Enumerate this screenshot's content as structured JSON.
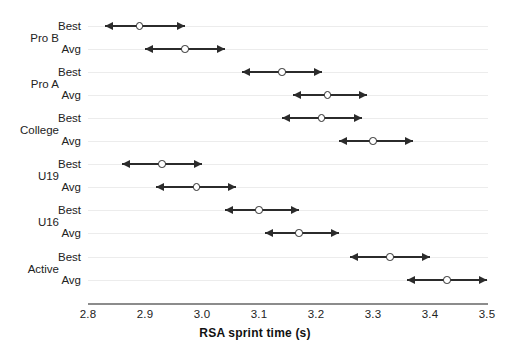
{
  "chart_data": {
    "type": "scatter",
    "title": "",
    "xlabel": "RSA sprint time (s)",
    "ylabel": "",
    "xlim": [
      2.8,
      3.5
    ],
    "xticks": [
      "2.8",
      "2.9",
      "3.0",
      "3.1",
      "3.2",
      "3.3",
      "3.4",
      "3.5"
    ],
    "xtick_values": [
      2.8,
      2.9,
      3.0,
      3.1,
      3.2,
      3.3,
      3.4,
      3.5
    ],
    "grid": true,
    "legend": "none",
    "marker_style": "open-circle-with-double-headed-arrow-range",
    "groups": [
      "Pro B",
      "Pro A",
      "College",
      "U19",
      "U16",
      "Active"
    ],
    "subcategories": [
      "Best",
      "Avg"
    ],
    "categories": [
      "Pro B Best",
      "Pro B Avg",
      "Pro A Best",
      "Pro A Avg",
      "College Best",
      "College Avg",
      "U19 Best",
      "U19 Avg",
      "U16 Best",
      "U16 Avg",
      "Active Best",
      "Active Avg"
    ],
    "values": [
      2.89,
      2.97,
      3.14,
      3.22,
      3.21,
      3.3,
      2.93,
      2.99,
      3.1,
      3.17,
      3.33,
      3.43
    ],
    "lower": [
      2.83,
      2.9,
      3.07,
      3.16,
      3.14,
      3.24,
      2.86,
      2.92,
      3.04,
      3.11,
      3.26,
      3.36
    ],
    "upper": [
      2.97,
      3.04,
      3.21,
      3.29,
      3.28,
      3.37,
      3.0,
      3.06,
      3.17,
      3.24,
      3.4,
      3.5
    ],
    "points": [
      {
        "group": "Pro B",
        "sub": "Best",
        "value": 2.89,
        "lower": 2.83,
        "upper": 2.97
      },
      {
        "group": "Pro B",
        "sub": "Avg",
        "value": 2.97,
        "lower": 2.9,
        "upper": 3.04
      },
      {
        "group": "Pro A",
        "sub": "Best",
        "value": 3.14,
        "lower": 3.07,
        "upper": 3.21
      },
      {
        "group": "Pro A",
        "sub": "Avg",
        "value": 3.22,
        "lower": 3.16,
        "upper": 3.29
      },
      {
        "group": "College",
        "sub": "Best",
        "value": 3.21,
        "lower": 3.14,
        "upper": 3.28
      },
      {
        "group": "College",
        "sub": "Avg",
        "value": 3.3,
        "lower": 3.24,
        "upper": 3.37
      },
      {
        "group": "U19",
        "sub": "Best",
        "value": 2.93,
        "lower": 2.86,
        "upper": 3.0
      },
      {
        "group": "U19",
        "sub": "Avg",
        "value": 2.99,
        "lower": 2.92,
        "upper": 3.06
      },
      {
        "group": "U16",
        "sub": "Best",
        "value": 3.1,
        "lower": 3.04,
        "upper": 3.17
      },
      {
        "group": "U16",
        "sub": "Avg",
        "value": 3.17,
        "lower": 3.11,
        "upper": 3.24
      },
      {
        "group": "Active",
        "sub": "Best",
        "value": 3.33,
        "lower": 3.26,
        "upper": 3.4
      },
      {
        "group": "Active",
        "sub": "Avg",
        "value": 3.43,
        "lower": 3.36,
        "upper": 3.5
      }
    ],
    "colors": {
      "marker_fill": "#ffffff",
      "marker_edge": "#2b2b2b",
      "arrow": "#2b2b2b",
      "gridline": "#ececec",
      "axis": "#8c8c8c",
      "text": "#222222",
      "background": "#ffffff"
    }
  }
}
